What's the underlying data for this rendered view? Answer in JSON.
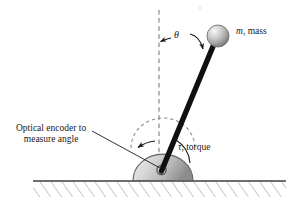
{
  "figure": {
    "background_color": "#ffffff",
    "width": 293,
    "height": 210
  },
  "labels": {
    "mass_symbol": "m",
    "mass_text": ", mass",
    "theta": "θ",
    "torque_symbol": "τ",
    "torque_text": ", torque",
    "encoder_line1": "Optical encoder to",
    "encoder_line2": "measure angle"
  },
  "colors": {
    "ink": "#1a1a1a",
    "rod": "#111111",
    "dashed_line": "#8c8c8c",
    "hatch": "#9a9a9a",
    "ground_line": "#444444",
    "sphere_light": "#f2f2f2",
    "sphere_mid": "#b9b9b9",
    "sphere_dark": "#7e7e7e",
    "base_light": "#e8e8e8",
    "base_mid": "#c2c2c2",
    "base_dark": "#8f8f8f",
    "base_outline": "#5e5e5e"
  },
  "geometry": {
    "pivot_x": 161,
    "pivot_y": 170,
    "vertical_dashed_x": 159,
    "vertical_dashed_top_y": 10,
    "vertical_dashed_bottom_y": 180,
    "rod_tip_x": 214,
    "rod_tip_y": 44,
    "rod_width": 5.5,
    "mass_center_x": 218,
    "mass_center_y": 36,
    "mass_radius": 11,
    "base_center_x": 163,
    "base_radius_x": 30,
    "base_radius_y": 26,
    "ground_y": 181,
    "ground_x_start": 33,
    "ground_x_end": 286,
    "hatch_bottom_y": 197,
    "angle_degrees": 23
  },
  "annotations": {
    "theta_arc_label": "θ",
    "theta_arrow_to_vertical": true,
    "theta_arrow_to_rod": true,
    "torque_arc": true,
    "encoder_pointer": true,
    "encoder_arc_arrow": true
  }
}
